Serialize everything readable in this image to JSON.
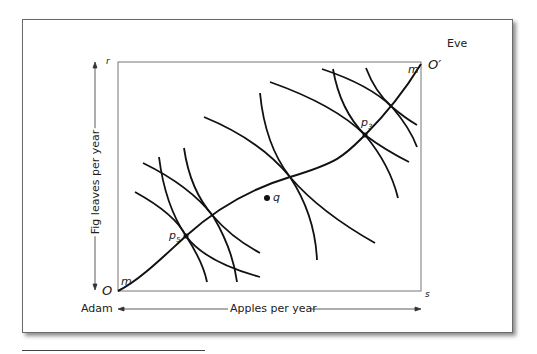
{
  "figure": {
    "type": "Edgeworth box",
    "labels": {
      "eve": "Eve",
      "adam": "Adam",
      "origin_adam": "O",
      "origin_eve": "O′",
      "corner_top_left": "r",
      "corner_bottom_right": "s",
      "contract_curve_low": "m",
      "contract_curve_high": "m",
      "point_p5": "p",
      "point_p5_sub": "5",
      "point_p3": "p",
      "point_p3_sub": "3",
      "point_q": "q"
    },
    "axes": {
      "x_label": "Apples per year",
      "y_label": "Fig leaves per year"
    },
    "colors": {
      "curve": "#111111",
      "box": "#777777",
      "text": "#222222"
    }
  }
}
